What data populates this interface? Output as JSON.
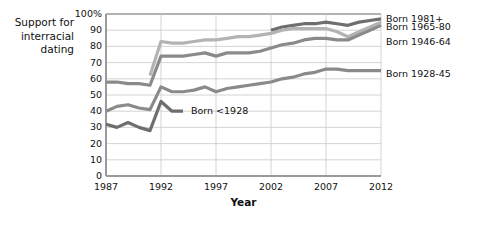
{
  "chart_data": {
    "type": "line",
    "title": "",
    "ylabel": "Support for\ninterracial\ndating",
    "xlabel": "Year",
    "xlim": [
      1987,
      2012
    ],
    "ylim": [
      0,
      100
    ],
    "grid": true,
    "legend_position": "right-inline",
    "x_ticks": [
      "1987",
      "1992",
      "1997",
      "2002",
      "2007",
      "2012"
    ],
    "x_tick_values": [
      1987,
      1992,
      1997,
      2002,
      2007,
      2012
    ],
    "y_ticks": [
      "0",
      "10",
      "20",
      "30",
      "40",
      "50",
      "60",
      "70",
      "80",
      "90",
      "100%"
    ],
    "y_tick_values": [
      0,
      10,
      20,
      30,
      40,
      50,
      60,
      70,
      80,
      90,
      100
    ],
    "series": [
      {
        "name": "Born 1981+",
        "color": "#6e6e6e",
        "label_x": 1992,
        "x": [
          2002,
          2003,
          2004,
          2005,
          2006,
          2007,
          2008,
          2009,
          2010,
          2011,
          2012
        ],
        "values": [
          90,
          92,
          93,
          94,
          94,
          95,
          94,
          93,
          95,
          96,
          97
        ]
      },
      {
        "name": "Born 1965-80",
        "color": "#b3b3b3",
        "x": [
          1991,
          1992,
          1993,
          1994,
          1995,
          1996,
          1997,
          1998,
          1999,
          2000,
          2001,
          2002,
          2003,
          2004,
          2005,
          2006,
          2007,
          2008,
          2009,
          2010,
          2011,
          2012
        ],
        "values": [
          62,
          83,
          82,
          82,
          83,
          84,
          84,
          85,
          86,
          86,
          87,
          88,
          90,
          91,
          91,
          91,
          91,
          89,
          86,
          89,
          92,
          95
        ]
      },
      {
        "name": "Born 1946-64",
        "color": "#8a8a8a",
        "x": [
          1987,
          1988,
          1989,
          1990,
          1991,
          1992,
          1993,
          1994,
          1995,
          1996,
          1997,
          1998,
          1999,
          2000,
          2001,
          2002,
          2003,
          2004,
          2005,
          2006,
          2007,
          2008,
          2009,
          2010,
          2011,
          2012
        ],
        "values": [
          58,
          58,
          57,
          57,
          56,
          74,
          74,
          74,
          75,
          76,
          74,
          76,
          76,
          76,
          77,
          79,
          81,
          82,
          84,
          85,
          85,
          84,
          84,
          87,
          90,
          93
        ]
      },
      {
        "name": "Born 1928-45",
        "color": "#8a8a8a",
        "x": [
          1987,
          1988,
          1989,
          1990,
          1991,
          1992,
          1993,
          1994,
          1995,
          1996,
          1997,
          1998,
          1999,
          2000,
          2001,
          2002,
          2003,
          2004,
          2005,
          2006,
          2007,
          2008,
          2009,
          2010,
          2011,
          2012
        ],
        "values": [
          40,
          43,
          44,
          42,
          41,
          55,
          52,
          52,
          53,
          55,
          52,
          54,
          55,
          56,
          57,
          58,
          60,
          61,
          63,
          64,
          66,
          66,
          65,
          65,
          65,
          65
        ]
      },
      {
        "name": "Born <1928",
        "color": "#6e6e6e",
        "x": [
          1987,
          1988,
          1989,
          1990,
          1991,
          1992,
          1993,
          1994
        ],
        "values": [
          32,
          30,
          33,
          30,
          28,
          46,
          40,
          40
        ]
      }
    ],
    "annotations": [
      {
        "text": "Born 1981+",
        "x": 2012,
        "y": 97
      },
      {
        "text": "Born 1965-80",
        "x": 2012,
        "y": 92
      },
      {
        "text": "Born 1946-64",
        "x": 2012,
        "y": 83
      },
      {
        "text": "Born 1928-45",
        "x": 2012,
        "y": 63
      },
      {
        "text": "Born <1928",
        "x": 1994,
        "y": 40
      }
    ]
  },
  "labels": {
    "y_axis_title": "Support for\ninterracial\ndating",
    "x_axis_title": "Year",
    "series_1981": "Born 1981+",
    "series_1965": "Born 1965-80",
    "series_1946": "Born 1946-64",
    "series_1928_45": "Born 1928-45",
    "series_pre1928": "Born <1928"
  },
  "colors": {
    "line_darkest": "#6e6e6e",
    "line_mid": "#8a8a8a",
    "line_light": "#b3b3b3",
    "grid": "#c9c9c9",
    "axis": "#9a9a9a",
    "text": "#111111",
    "background": "#ffffff"
  }
}
